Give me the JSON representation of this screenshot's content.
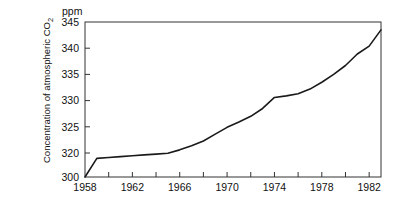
{
  "chart_data": {
    "type": "line",
    "title": "",
    "subtitle": "",
    "xlabel": "",
    "ylabel": "Concentration of atmospheric CO₂",
    "unit_label": "ppm",
    "xlim": [
      1958,
      1983
    ],
    "ylim": [
      300,
      345
    ],
    "y_axis_break": true,
    "y_break_note": "Axis compressed between 300 and 320; one interval spans 300–320, remaining intervals span 5 ppm each",
    "grid": false,
    "legend": null,
    "y_ticks": [
      345,
      340,
      335,
      330,
      325,
      320,
      300
    ],
    "y_tick_labels": [
      "345",
      "340",
      "335",
      "330",
      "325",
      "320",
      "300"
    ],
    "x_ticks": [
      1958,
      1960,
      1962,
      1964,
      1966,
      1968,
      1970,
      1972,
      1974,
      1976,
      1978,
      1980,
      1982
    ],
    "x_tick_labels_major": [
      "1958",
      "1962",
      "1966",
      "1970",
      "1974",
      "1978",
      "1982"
    ],
    "x_major_ticks": [
      1958,
      1962,
      1966,
      1970,
      1974,
      1978,
      1982
    ],
    "series": [
      {
        "name": "Atmospheric CO₂ concentration",
        "color": "#1a1a1a",
        "x": [
          1958,
          1959,
          1960,
          1961,
          1962,
          1963,
          1964,
          1965,
          1966,
          1967,
          1968,
          1969,
          1970,
          1971,
          1972,
          1973,
          1974,
          1975,
          1976,
          1977,
          1978,
          1979,
          1980,
          1981,
          1982,
          1983
        ],
        "y": [
          300.0,
          315.5,
          316.3,
          317.0,
          317.7,
          318.4,
          319.1,
          319.8,
          320.6,
          321.4,
          322.3,
          323.6,
          324.9,
          325.9,
          327.0,
          328.5,
          330.6,
          330.9,
          331.3,
          332.2,
          333.5,
          335.0,
          336.7,
          338.9,
          340.4,
          343.5
        ]
      }
    ],
    "annotations": []
  },
  "figure": {
    "background": "#ffffff",
    "frame_color": "#333333",
    "line_color": "#1a1a1a"
  }
}
